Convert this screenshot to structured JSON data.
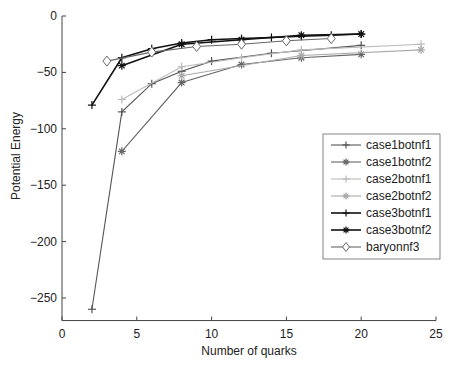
{
  "chart_data": {
    "type": "line",
    "title": "",
    "xlabel": "Number of quarks",
    "ylabel": "Potential Energy",
    "xlim": [
      0,
      25
    ],
    "ylim": [
      -270,
      0
    ],
    "xticks": [
      0,
      5,
      10,
      15,
      20,
      25
    ],
    "yticks": [
      0,
      -50,
      -100,
      -150,
      -200,
      -250
    ],
    "grid": false,
    "legend_position": "right-center",
    "series": [
      {
        "name": "case1botnf1",
        "color": "#555555",
        "marker": "+",
        "x": [
          2,
          4,
          6,
          8,
          10,
          14,
          20
        ],
        "y": [
          -260,
          -85,
          -60,
          -49,
          -40,
          -33,
          -26
        ]
      },
      {
        "name": "case1botnf2",
        "color": "#666666",
        "marker": "*",
        "x": [
          4,
          8,
          12,
          16,
          20
        ],
        "y": [
          -120,
          -59,
          -43,
          -37,
          -34
        ]
      },
      {
        "name": "case2botnf1",
        "color": "#bbbbbb",
        "marker": "+",
        "x": [
          4,
          8,
          12,
          16,
          24
        ],
        "y": [
          -74,
          -45,
          -37,
          -30,
          -25
        ]
      },
      {
        "name": "case2botnf2",
        "color": "#aaaaaa",
        "marker": "*",
        "x": [
          8,
          16,
          24
        ],
        "y": [
          -53,
          -35,
          -30
        ]
      },
      {
        "name": "case3botnf1",
        "color": "#111111",
        "marker": "+",
        "x": [
          2,
          4,
          6,
          8,
          10,
          12,
          14,
          16,
          18,
          20
        ],
        "y": [
          -79,
          -37,
          -29,
          -24,
          -21,
          -20,
          -19,
          -18,
          -17,
          -16
        ]
      },
      {
        "name": "case3botnf2",
        "color": "#111111",
        "marker": "*",
        "x": [
          4,
          8,
          12,
          16,
          20
        ],
        "y": [
          -44,
          -25,
          -21,
          -17,
          -16
        ]
      },
      {
        "name": "baryonnf3",
        "color": "#666666",
        "marker": "diamond",
        "x": [
          3,
          6,
          9,
          12,
          15,
          18
        ],
        "y": [
          -40,
          -32,
          -27,
          -25,
          -22,
          -20
        ]
      }
    ]
  }
}
